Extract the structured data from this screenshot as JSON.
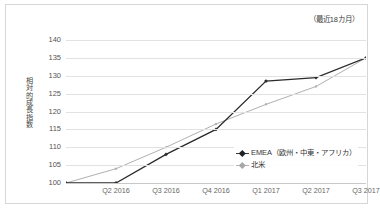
{
  "annotation": "（最近18カ月）",
  "legend": {
    "items": [
      {
        "label": "EMEA（欧州・中東・アフリカ）",
        "color": "#2b2b2b",
        "marker": "diamond-marker-icon"
      },
      {
        "label": "北米",
        "color": "#b0b0b0",
        "marker": "diamond-marker-icon"
      }
    ]
  },
  "chart_data": {
    "type": "line",
    "title": "",
    "subtitle": "",
    "annotation": "（最近18カ月）",
    "xlabel": "",
    "ylabel": "相対的成長指数",
    "categories": [
      "",
      "Q2 2016",
      "Q3 2016",
      "Q4 2016",
      "Q1 2017",
      "Q2 2017",
      "Q3 2017"
    ],
    "x_tick_labels": [
      "Q2 2016",
      "Q3 2016",
      "Q4 2016",
      "Q1 2017",
      "Q2 2017",
      "Q3 2017"
    ],
    "y_tick_labels": [
      "140",
      "135",
      "130",
      "125",
      "120",
      "115",
      "110",
      "105",
      "100"
    ],
    "ylim": [
      100,
      140
    ],
    "ystep": 5,
    "grid": true,
    "legend_position": "inside-lower-right",
    "series": [
      {
        "name": "EMEA（欧州・中東・アフリカ）",
        "color": "#2b2b2b",
        "values": [
          100,
          100,
          108,
          115,
          128.5,
          129.5,
          135
        ]
      },
      {
        "name": "北米",
        "color": "#b0b0b0",
        "values": [
          100,
          104,
          110,
          116.5,
          122,
          127,
          135
        ]
      }
    ]
  }
}
